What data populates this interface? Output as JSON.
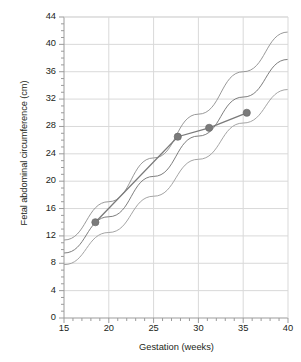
{
  "chart_data": {
    "type": "line",
    "title": "",
    "xlabel": "Gestation (weeks)",
    "ylabel": "Fetal abdominal circumference (cm)",
    "xlim": [
      15,
      40
    ],
    "ylim": [
      0,
      44
    ],
    "xticks": [
      15,
      20,
      25,
      30,
      35,
      40
    ],
    "yticks": [
      0,
      4,
      8,
      12,
      16,
      20,
      24,
      28,
      32,
      36,
      40,
      44
    ],
    "x_minor_tick_step": 1,
    "grid": "horizontal-and-vertical-major",
    "legend": "none",
    "series": [
      {
        "name": "upper-centile-reference-curve",
        "type": "line",
        "color": "#8d8d8d",
        "marker": "none",
        "points": [
          {
            "x": 15,
            "y": 11.4
          },
          {
            "x": 20,
            "y": 17.0
          },
          {
            "x": 25,
            "y": 23.4
          },
          {
            "x": 30,
            "y": 29.8
          },
          {
            "x": 35,
            "y": 36.0
          },
          {
            "x": 40,
            "y": 41.8
          }
        ]
      },
      {
        "name": "median-reference-curve",
        "type": "line",
        "color": "#6f6f6f",
        "marker": "none",
        "points": [
          {
            "x": 15,
            "y": 9.5
          },
          {
            "x": 20,
            "y": 14.8
          },
          {
            "x": 25,
            "y": 20.7
          },
          {
            "x": 30,
            "y": 26.6
          },
          {
            "x": 35,
            "y": 32.3
          },
          {
            "x": 40,
            "y": 37.8
          }
        ]
      },
      {
        "name": "lower-centile-reference-curve",
        "type": "line",
        "color": "#9a9a9a",
        "marker": "none",
        "points": [
          {
            "x": 15,
            "y": 7.8
          },
          {
            "x": 20,
            "y": 12.5
          },
          {
            "x": 25,
            "y": 17.8
          },
          {
            "x": 30,
            "y": 23.2
          },
          {
            "x": 35,
            "y": 28.5
          },
          {
            "x": 40,
            "y": 33.4
          }
        ]
      },
      {
        "name": "measured-fetal-abdominal-circumference",
        "type": "line-with-markers",
        "color": "#7a7a7a",
        "marker": "circle",
        "points": [
          {
            "x": 18.5,
            "y": 14.0
          },
          {
            "x": 27.7,
            "y": 26.5
          },
          {
            "x": 31.2,
            "y": 27.8
          },
          {
            "x": 35.4,
            "y": 30.0
          }
        ]
      }
    ]
  },
  "axes": {
    "y_title": "Fetal abdominal circumference (cm)",
    "x_title": "Gestation (weeks)",
    "y_tick_labels": [
      "0",
      "4",
      "8",
      "12",
      "16",
      "20",
      "24",
      "28",
      "32",
      "36",
      "40",
      "44"
    ],
    "x_tick_labels": [
      "15",
      "20",
      "25",
      "30",
      "35",
      "40"
    ]
  },
  "colors": {
    "axis": "#9b9b9b",
    "grid": "#d9d9d9",
    "text": "#231f20",
    "data": "#7a7a7a",
    "reference_curve": "#8d8d8d",
    "background": "#ffffff"
  }
}
